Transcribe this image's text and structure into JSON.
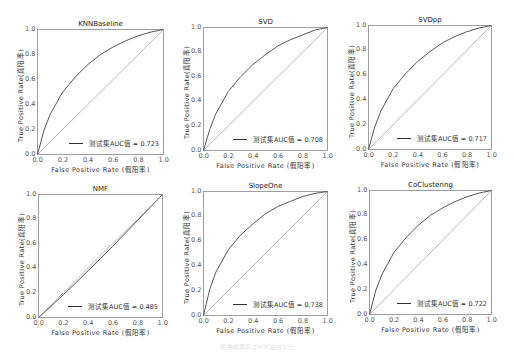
{
  "figure": {
    "caption": "图 各推荐算法ROC曲线对比"
  },
  "chart_data": [
    {
      "type": "line",
      "title": "KNNBaseline",
      "xlabel": "False Positive Rate (假阳率)",
      "ylabel": "True Positive Rate(真阳率)",
      "xlim": [
        0,
        1
      ],
      "ylim": [
        0,
        1
      ],
      "xticks": [
        "0.0",
        "0.2",
        "0.4",
        "0.6",
        "0.8",
        "1.0"
      ],
      "yticks": [
        "0.0",
        "0.2",
        "0.4",
        "0.6",
        "0.8",
        "1.0"
      ],
      "grid": false,
      "legend_position": "lower right",
      "series": [
        {
          "name": "测试集AUC值 = 0.723",
          "auc": 0.723,
          "x": [
            0,
            0.05,
            0.1,
            0.2,
            0.3,
            0.4,
            0.5,
            0.6,
            0.7,
            0.8,
            0.9,
            1.0
          ],
          "y": [
            0,
            0.19,
            0.32,
            0.5,
            0.62,
            0.72,
            0.8,
            0.86,
            0.91,
            0.95,
            0.98,
            1.0
          ]
        },
        {
          "name": "diagonal",
          "style": "dotted",
          "x": [
            0,
            1
          ],
          "y": [
            0,
            1
          ]
        }
      ]
    },
    {
      "type": "line",
      "title": "SVD",
      "xlabel": "False Positive Rate (假阳率)",
      "ylabel": "True Positive Rate(真阳率)",
      "xlim": [
        0,
        1
      ],
      "ylim": [
        0,
        1
      ],
      "xticks": [
        "0.0",
        "0.2",
        "0.4",
        "0.6",
        "0.8",
        "1.0"
      ],
      "yticks": [
        "0.0",
        "0.2",
        "0.4",
        "0.6",
        "0.8",
        "1.0"
      ],
      "grid": false,
      "legend_position": "lower right",
      "series": [
        {
          "name": "测试集AUC值 = 0.708",
          "auc": 0.708,
          "x": [
            0,
            0.05,
            0.1,
            0.2,
            0.3,
            0.4,
            0.5,
            0.6,
            0.7,
            0.8,
            0.9,
            1.0
          ],
          "y": [
            0,
            0.17,
            0.3,
            0.48,
            0.6,
            0.7,
            0.78,
            0.85,
            0.9,
            0.94,
            0.98,
            1.0
          ]
        },
        {
          "name": "diagonal",
          "style": "dotted",
          "x": [
            0,
            1
          ],
          "y": [
            0,
            1
          ]
        }
      ]
    },
    {
      "type": "line",
      "title": "SVDpp",
      "xlabel": "False Positive Rate (假阳率)",
      "ylabel": "True Positive Rate(真阳率)",
      "xlim": [
        0,
        1
      ],
      "ylim": [
        0,
        1
      ],
      "xticks": [
        "0.0",
        "0.2",
        "0.4",
        "0.6",
        "0.8",
        "1.0"
      ],
      "yticks": [
        "0.0",
        "0.2",
        "0.4",
        "0.6",
        "0.8",
        "1.0"
      ],
      "grid": false,
      "legend_position": "lower right",
      "series": [
        {
          "name": "测试集AUC值 = 0.717",
          "auc": 0.717,
          "x": [
            0,
            0.05,
            0.1,
            0.2,
            0.3,
            0.4,
            0.5,
            0.6,
            0.7,
            0.8,
            0.9,
            1.0
          ],
          "y": [
            0,
            0.18,
            0.31,
            0.49,
            0.61,
            0.71,
            0.79,
            0.86,
            0.91,
            0.95,
            0.98,
            1.0
          ]
        },
        {
          "name": "diagonal",
          "style": "dotted",
          "x": [
            0,
            1
          ],
          "y": [
            0,
            1
          ]
        }
      ]
    },
    {
      "type": "line",
      "title": "NMF",
      "xlabel": "False Positive Rate (假阳率)",
      "ylabel": "True Positive Rate(真阳率)",
      "xlim": [
        0,
        1
      ],
      "ylim": [
        0,
        1
      ],
      "xticks": [
        "0.0",
        "0.2",
        "0.4",
        "0.6",
        "0.8",
        "1.0"
      ],
      "yticks": [
        "0.0",
        "0.2",
        "0.4",
        "0.6",
        "0.8",
        "1.0"
      ],
      "grid": false,
      "legend_position": "lower right",
      "series": [
        {
          "name": "测试集AUC值 = 0.485",
          "auc": 0.485,
          "x": [
            0,
            0.1,
            0.2,
            0.3,
            0.4,
            0.5,
            0.6,
            0.7,
            0.8,
            0.9,
            1.0
          ],
          "y": [
            0,
            0.09,
            0.185,
            0.28,
            0.38,
            0.48,
            0.58,
            0.685,
            0.79,
            0.895,
            1.0
          ]
        },
        {
          "name": "diagonal",
          "style": "dotted",
          "x": [
            0,
            1
          ],
          "y": [
            0,
            1
          ]
        }
      ]
    },
    {
      "type": "line",
      "title": "SlopeOne",
      "xlabel": "False Positive Rate (假阳率)",
      "ylabel": "True Positive Rate(真阳率)",
      "xlim": [
        0,
        1
      ],
      "ylim": [
        0,
        1
      ],
      "xticks": [
        "0.0",
        "0.2",
        "0.4",
        "0.6",
        "0.8",
        "1.0"
      ],
      "yticks": [
        "0.0",
        "0.2",
        "0.4",
        "0.6",
        "0.8",
        "1.0"
      ],
      "grid": false,
      "legend_position": "lower right",
      "series": [
        {
          "name": "测试集AUC值 = 0.738",
          "auc": 0.738,
          "x": [
            0,
            0.05,
            0.1,
            0.2,
            0.3,
            0.4,
            0.5,
            0.6,
            0.7,
            0.8,
            0.9,
            1.0
          ],
          "y": [
            0,
            0.21,
            0.35,
            0.53,
            0.65,
            0.74,
            0.82,
            0.88,
            0.92,
            0.96,
            0.985,
            1.0
          ]
        },
        {
          "name": "diagonal",
          "style": "dotted",
          "x": [
            0,
            1
          ],
          "y": [
            0,
            1
          ]
        }
      ]
    },
    {
      "type": "line",
      "title": "CoClustering",
      "xlabel": "False Positive Rate (假阳率)",
      "ylabel": "True Positive Rate(真阳率)",
      "xlim": [
        0,
        1
      ],
      "ylim": [
        0,
        1
      ],
      "xticks": [
        "0.0",
        "0.2",
        "0.4",
        "0.6",
        "0.8",
        "1.0"
      ],
      "yticks": [
        "0.0",
        "0.2",
        "0.4",
        "0.6",
        "0.8",
        "1.0"
      ],
      "grid": false,
      "legend_position": "lower right",
      "series": [
        {
          "name": "测试集AUC值 = 0.722",
          "auc": 0.722,
          "x": [
            0,
            0.05,
            0.1,
            0.2,
            0.3,
            0.4,
            0.5,
            0.6,
            0.7,
            0.8,
            0.9,
            1.0
          ],
          "y": [
            0,
            0.19,
            0.32,
            0.5,
            0.62,
            0.72,
            0.8,
            0.86,
            0.91,
            0.95,
            0.98,
            1.0
          ]
        },
        {
          "name": "diagonal",
          "style": "dotted",
          "x": [
            0,
            1
          ],
          "y": [
            0,
            1
          ]
        }
      ]
    }
  ],
  "layout": {
    "panels": [
      {
        "left": 37,
        "top": 29,
        "w": 127,
        "h": 126
      },
      {
        "left": 203,
        "top": 27,
        "w": 125,
        "h": 124
      },
      {
        "left": 368,
        "top": 25,
        "w": 124,
        "h": 125
      },
      {
        "left": 38,
        "top": 194,
        "w": 125,
        "h": 124
      },
      {
        "left": 203,
        "top": 191,
        "w": 125,
        "h": 125
      },
      {
        "left": 369,
        "top": 190,
        "w": 123,
        "h": 125
      }
    ],
    "line_color": "#444444",
    "diag_color": "#888888",
    "frame_color": "#888888"
  }
}
